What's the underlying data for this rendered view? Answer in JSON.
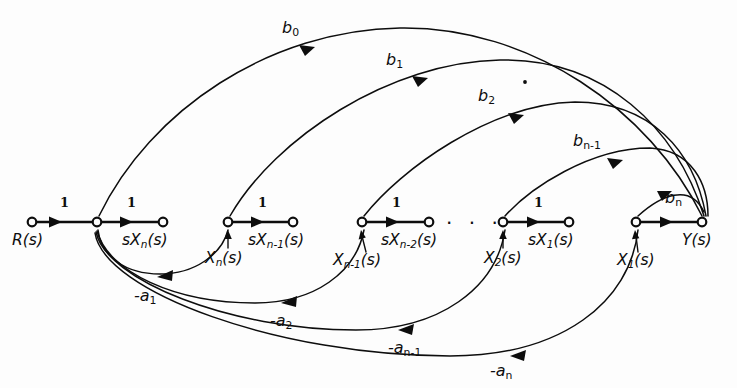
{
  "figure": {
    "kind": "signal-flow-graph",
    "background_color": "#fdfdfd",
    "ink_color": "#0d0d0d"
  },
  "nodes": [
    {
      "id": "R",
      "label": "R(s)",
      "x": 32,
      "y": 222,
      "label_x": 12,
      "label_y": 233
    },
    {
      "id": "sum",
      "label": "",
      "x": 97,
      "y": 222,
      "label_x": 0,
      "label_y": 0
    },
    {
      "id": "sXn",
      "label": "sX",
      "sub": "n",
      "tail": "(s)",
      "x": 163,
      "y": 222,
      "label_x": 122,
      "label_y": 233
    },
    {
      "id": "Xn",
      "label": "",
      "x": 228,
      "y": 222,
      "label_x": 0,
      "label_y": 0
    },
    {
      "id": "sXn1",
      "label": "sX",
      "sub": "n-1",
      "tail": "(s)",
      "x": 293,
      "y": 222,
      "label_x": 248,
      "label_y": 233
    },
    {
      "id": "Xn1",
      "label": "",
      "x": 362,
      "y": 222,
      "label_x": 0,
      "label_y": 0
    },
    {
      "id": "sXn2",
      "label": "sX",
      "sub": "n-2",
      "tail": "(s)",
      "x": 429,
      "y": 222,
      "label_x": 381,
      "label_y": 233
    },
    {
      "id": "X2",
      "label": "",
      "x": 503,
      "y": 222,
      "label_x": 0,
      "label_y": 0
    },
    {
      "id": "sX1",
      "label": "sX",
      "sub": "1",
      "tail": "(s)",
      "x": 569,
      "y": 222,
      "label_x": 528,
      "label_y": 233
    },
    {
      "id": "X1",
      "label": "",
      "x": 636,
      "y": 222,
      "label_x": 0,
      "label_y": 0
    },
    {
      "id": "Y",
      "label": "Y(s)",
      "x": 702,
      "y": 222,
      "label_x": 682,
      "label_y": 233
    }
  ],
  "state_labels": [
    {
      "base": "X",
      "sub": "n",
      "tail": "(s)",
      "x": 205,
      "y": 251,
      "tick_x": 228,
      "tick_y0": 248,
      "tick_y1": 234
    },
    {
      "base": "X",
      "sub": "n-1",
      "tail": "(s)",
      "x": 333,
      "y": 253,
      "tick_x": 362,
      "tick_y0": 250,
      "tick_y1": 234
    },
    {
      "base": "X",
      "sub": "2",
      "tail": "(s)",
      "x": 484,
      "y": 251,
      "tick_x": 503,
      "tick_y0": 248,
      "tick_y1": 234
    },
    {
      "base": "X",
      "sub": "1",
      "tail": "(s)",
      "x": 617,
      "y": 253,
      "tick_x": 636,
      "tick_y0": 250,
      "tick_y1": 234
    }
  ],
  "unity_gains": [
    {
      "label": "1",
      "x": 60,
      "y": 196
    },
    {
      "label": "1",
      "x": 127,
      "y": 196
    },
    {
      "label": "1",
      "x": 258,
      "y": 196
    },
    {
      "label": "1",
      "x": 392,
      "y": 196
    },
    {
      "label": "1",
      "x": 534,
      "y": 196
    }
  ],
  "forward_gains": [
    {
      "id": "b0",
      "base": "b",
      "sub": "0",
      "x": 282,
      "y": 20,
      "from": "sum",
      "to": "Y"
    },
    {
      "id": "b1",
      "base": "b",
      "sub": "1",
      "x": 386,
      "y": 52,
      "from": "Xn",
      "to": "Y"
    },
    {
      "id": "b2",
      "base": "b",
      "sub": "2",
      "x": 478,
      "y": 88,
      "from": "Xn1",
      "to": "Y"
    },
    {
      "id": "bn-1",
      "base": "b",
      "sub": "n-1",
      "x": 573,
      "y": 133,
      "from": "X2",
      "to": "Y"
    },
    {
      "id": "bn",
      "base": "b",
      "sub": "n",
      "x": 665,
      "y": 190,
      "from": "X1",
      "to": "Y"
    }
  ],
  "feedback_gains": [
    {
      "id": "-a1",
      "sign": "-",
      "base": "a",
      "sub": "1",
      "x": 134,
      "y": 288,
      "from": "Xn",
      "to": "sum"
    },
    {
      "id": "-a2",
      "sign": "-",
      "base": "a",
      "sub": "2",
      "x": 270,
      "y": 313,
      "from": "Xn1",
      "to": "sum"
    },
    {
      "id": "-an-1",
      "sign": "-",
      "base": "a",
      "sub": "n-1",
      "x": 388,
      "y": 340,
      "from": "X2",
      "to": "sum"
    },
    {
      "id": "-an",
      "sign": "-",
      "base": "a",
      "sub": "n",
      "x": 490,
      "y": 363,
      "from": "X1",
      "to": "sum"
    }
  ],
  "ellipses": [
    {
      "id": "chain-ellipsis",
      "text": "· · ·",
      "x": 446,
      "y": 213
    },
    {
      "id": "branch-dot",
      "x": 525,
      "y": 82
    }
  ]
}
